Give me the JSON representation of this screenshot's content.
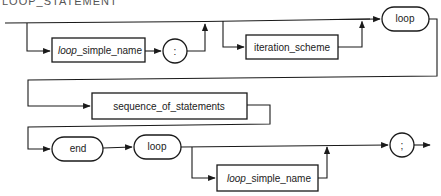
{
  "title": "LOOP_STATEMENT",
  "diagram": {
    "type": "railroad-syntax-diagram",
    "colors": {
      "stroke": "#1a1a1a",
      "text": "#222222",
      "background": "#ffffff"
    },
    "nodes": {
      "label_name_prefix": "loop",
      "label_name_suffix": "_simple_name",
      "colon": ":",
      "iteration_scheme": "iteration_scheme",
      "loop_kw_1": "loop",
      "sequence_of_statements": "sequence_of_statements",
      "end_kw": "end",
      "loop_kw_2": "loop",
      "end_name_prefix": "loop",
      "end_name_suffix": "_simple_name",
      "semicolon": ";"
    },
    "rows": [
      {
        "row": 1,
        "sequence": [
          "[optional] loop_simple_name",
          ":",
          "[optional] iteration_scheme",
          "loop"
        ]
      },
      {
        "row": 2,
        "sequence": [
          "sequence_of_statements"
        ]
      },
      {
        "row": 3,
        "sequence": [
          "end",
          "loop",
          "[optional] loop_simple_name",
          ";"
        ]
      }
    ]
  }
}
